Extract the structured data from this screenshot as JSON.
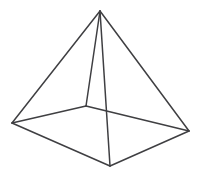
{
  "figure": {
    "type": "line-drawing",
    "width": 202,
    "height": 186,
    "background_color": "#ffffff",
    "stroke_color": "#3f3f42",
    "stroke_width": 1.5,
    "projection": "oblique perspective, viewed slightly from above",
    "vertices": [
      {
        "id": "apex",
        "label": "Apex",
        "x": 100,
        "y": 11,
        "hidden": false
      },
      {
        "id": "base-left",
        "label": "Base left",
        "x": 12,
        "y": 123,
        "hidden": false
      },
      {
        "id": "base-back",
        "label": "Base back",
        "x": 86,
        "y": 106,
        "hidden": true
      },
      {
        "id": "base-right",
        "label": "Base right",
        "x": 189,
        "y": 131,
        "hidden": false
      },
      {
        "id": "base-front",
        "label": "Base front",
        "x": 110,
        "y": 166,
        "hidden": false
      }
    ],
    "edges": [
      {
        "id": "apex-to-base-left",
        "from": "apex",
        "to": "base-left",
        "d": "M 100 11 L 12 123",
        "style": "solid"
      },
      {
        "id": "apex-to-base-back",
        "from": "apex",
        "to": "base-back",
        "d": "M 100 11 L 86 106",
        "style": "solid"
      },
      {
        "id": "apex-to-base-right",
        "from": "apex",
        "to": "base-right",
        "d": "M 100 11 L 189 131",
        "style": "solid"
      },
      {
        "id": "apex-to-base-front",
        "from": "apex",
        "to": "base-front",
        "d": "M 100 11 L 110 166",
        "style": "solid"
      },
      {
        "id": "base-left-to-back",
        "from": "base-left",
        "to": "base-back",
        "d": "M 12 123 L 86 106",
        "style": "solid"
      },
      {
        "id": "base-back-to-right",
        "from": "base-back",
        "to": "base-right",
        "d": "M 86 106 L 189 131",
        "style": "solid"
      },
      {
        "id": "base-right-to-front",
        "from": "base-right",
        "to": "base-front",
        "d": "M 189 131 L 110 166",
        "style": "solid"
      },
      {
        "id": "base-front-to-left",
        "from": "base-front",
        "to": "base-left",
        "d": "M 110 166 L 12 123",
        "style": "solid"
      }
    ],
    "counts": {
      "vertices": 5,
      "edges": 8,
      "faces": 5
    }
  }
}
